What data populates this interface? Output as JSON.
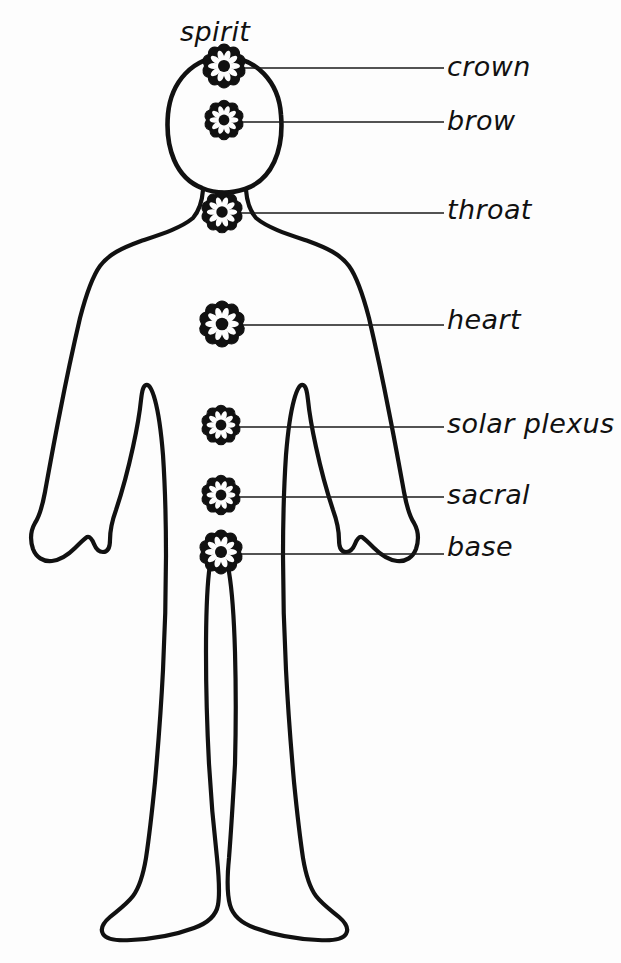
{
  "diagram": {
    "background_color": "#fdfdfd",
    "ink_color": "#111111",
    "style": "hand-drawn line art",
    "top_label": "spirit",
    "figure_name": "human-body-outline"
  },
  "labels": {
    "spirit": "spirit",
    "crown": "crown",
    "brow": "brow",
    "throat": "throat",
    "heart": "heart",
    "solar_plexus": "solar plexus",
    "sacral": "sacral",
    "base": "base"
  },
  "chakras": [
    {
      "id": "crown",
      "label": "crown",
      "cx": 224,
      "cy": 66,
      "r": 20,
      "petals": 10
    },
    {
      "id": "brow",
      "label": "brow",
      "cx": 224,
      "cy": 120,
      "r": 18,
      "petals": 10
    },
    {
      "id": "throat",
      "label": "throat",
      "cx": 222,
      "cy": 212,
      "r": 19,
      "petals": 10
    },
    {
      "id": "heart",
      "label": "heart",
      "cx": 222,
      "cy": 324,
      "r": 21,
      "petals": 10
    },
    {
      "id": "solar-plexus",
      "label": "solar plexus",
      "cx": 221,
      "cy": 425,
      "r": 18,
      "petals": 10
    },
    {
      "id": "sacral",
      "label": "sacral",
      "cx": 221,
      "cy": 495,
      "r": 18,
      "petals": 10
    },
    {
      "id": "base",
      "label": "base",
      "cx": 221,
      "cy": 552,
      "r": 20,
      "petals": 10
    }
  ],
  "leader_lines": [
    {
      "id": "leader-crown",
      "x1": 240,
      "y1": 68,
      "x2": 444,
      "y2": 68
    },
    {
      "id": "leader-brow",
      "x1": 240,
      "y1": 122,
      "x2": 444,
      "y2": 122
    },
    {
      "id": "leader-throat",
      "x1": 238,
      "y1": 213,
      "x2": 444,
      "y2": 213
    },
    {
      "id": "leader-heart",
      "x1": 241,
      "y1": 325,
      "x2": 444,
      "y2": 325
    },
    {
      "id": "leader-solar",
      "x1": 238,
      "y1": 427,
      "x2": 444,
      "y2": 427
    },
    {
      "id": "leader-sacral",
      "x1": 238,
      "y1": 497,
      "x2": 444,
      "y2": 497
    },
    {
      "id": "leader-base",
      "x1": 239,
      "y1": 554,
      "x2": 444,
      "y2": 554
    }
  ]
}
